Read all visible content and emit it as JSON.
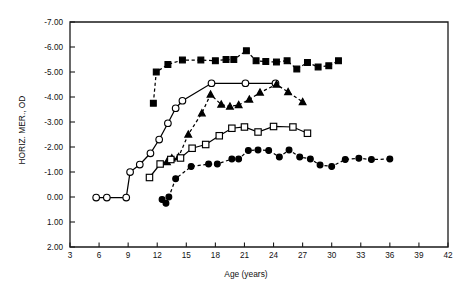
{
  "chart_data": {
    "type": "line",
    "title": "",
    "xlabel": "Age (years)",
    "ylabel": "HORIZ. MER., OD",
    "xlim": [
      3,
      42
    ],
    "ylim": [
      2.0,
      -7.0
    ],
    "y_inverted": true,
    "grid": false,
    "legend": "none",
    "xticks": [
      3,
      6,
      9,
      12,
      15,
      18,
      21,
      24,
      27,
      30,
      33,
      36,
      39,
      42
    ],
    "xticklabels": [
      "3",
      "6",
      "9",
      "12",
      "15",
      "18",
      "21",
      "24",
      "27",
      "30",
      "33",
      "36",
      "39",
      "42"
    ],
    "yticks": [
      -7.0,
      -6.0,
      -5.0,
      -4.0,
      -3.0,
      -2.0,
      -1.0,
      0.0,
      1.0,
      2.0
    ],
    "yticklabels": [
      "-7.00",
      "-6.00",
      "-5.00",
      "-4.00",
      "-3.00",
      "-2.00",
      "-1.00",
      "0.00",
      "1.00",
      "2.00"
    ],
    "series": [
      {
        "name": "subject-1",
        "marker": "filled-square",
        "line": "dashed",
        "x": [
          11.6,
          11.9,
          13.1,
          14.6,
          16.5,
          18.0,
          19.1,
          19.9,
          21.2,
          22.2,
          23.2,
          24.3,
          25.4,
          26.4,
          27.5,
          28.6,
          29.7,
          30.7
        ],
        "y": [
          -3.75,
          -5.0,
          -5.3,
          -5.48,
          -5.48,
          -5.45,
          -5.5,
          -5.5,
          -5.85,
          -5.45,
          -5.42,
          -5.4,
          -5.45,
          -5.12,
          -5.38,
          -5.2,
          -5.25,
          -5.45
        ]
      },
      {
        "name": "subject-2",
        "marker": "open-circle",
        "line": "solid",
        "x": [
          5.7,
          6.8,
          8.8,
          9.2,
          10.2,
          11.3,
          12.2,
          13.1,
          13.9,
          14.6,
          17.6,
          21.1,
          24.2
        ],
        "y": [
          0.02,
          0.02,
          0.02,
          -1.0,
          -1.3,
          -1.75,
          -2.3,
          -2.95,
          -3.55,
          -3.85,
          -4.55,
          -4.55,
          -4.55
        ]
      },
      {
        "name": "subject-3",
        "marker": "filled-triangle",
        "line": "dashed",
        "x": [
          13.0,
          13.5,
          14.2,
          15.2,
          16.6,
          17.5,
          18.6,
          19.5,
          20.4,
          21.5,
          22.6,
          24.3,
          25.5,
          27.0
        ],
        "y": [
          -1.4,
          -1.55,
          -1.6,
          -2.5,
          -3.35,
          -4.1,
          -3.7,
          -3.62,
          -3.68,
          -3.9,
          -4.18,
          -4.5,
          -4.2,
          -3.8
        ]
      },
      {
        "name": "subject-4",
        "marker": "open-square",
        "line": "solid",
        "x": [
          11.2,
          12.3,
          13.4,
          14.4,
          15.6,
          17.0,
          18.4,
          19.7,
          21.0,
          22.4,
          24.0,
          26.0,
          27.5
        ],
        "y": [
          -0.78,
          -1.32,
          -1.5,
          -1.56,
          -1.95,
          -2.1,
          -2.45,
          -2.75,
          -2.8,
          -2.6,
          -2.82,
          -2.8,
          -2.55
        ]
      },
      {
        "name": "subject-5",
        "marker": "filled-circle",
        "line": "dashed",
        "x": [
          12.5,
          12.9,
          13.2,
          13.9,
          15.5,
          17.3,
          18.2,
          19.7,
          20.4,
          21.4,
          22.4,
          23.5,
          24.6,
          25.6,
          26.7,
          27.8,
          28.8,
          30.0,
          31.4,
          32.8,
          34.1,
          36.0
        ],
        "y": [
          0.1,
          0.25,
          0.0,
          -0.73,
          -1.22,
          -1.32,
          -1.32,
          -1.52,
          -1.52,
          -1.86,
          -1.88,
          -1.86,
          -1.6,
          -1.88,
          -1.6,
          -1.52,
          -1.28,
          -1.22,
          -1.5,
          -1.55,
          -1.5,
          -1.52
        ]
      }
    ]
  }
}
